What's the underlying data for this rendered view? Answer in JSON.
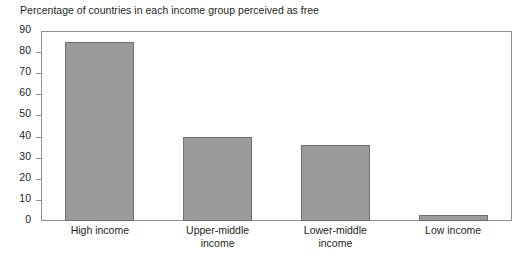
{
  "chart_data": {
    "type": "bar",
    "title": "Percentage of countries in each income group perceived as free",
    "xlabel": "",
    "ylabel": "",
    "ylim": [
      0,
      90
    ],
    "ytick_step": 10,
    "yticks": [
      90,
      80,
      70,
      60,
      50,
      40,
      30,
      20,
      10,
      0
    ],
    "grid": false,
    "legend": "none",
    "bar_color": "#9a9b9b",
    "bar_border_color": "#6e6f70",
    "axis_color": "#8d8f91",
    "categories": [
      "High income",
      "Upper-middle income",
      "Lower-middle income",
      "Low income"
    ],
    "category_lines": [
      [
        "High income"
      ],
      [
        "Upper-middle",
        "income"
      ],
      [
        "Lower-middle",
        "income"
      ],
      [
        "Low income"
      ]
    ],
    "values": [
      85,
      40,
      36,
      3
    ]
  }
}
